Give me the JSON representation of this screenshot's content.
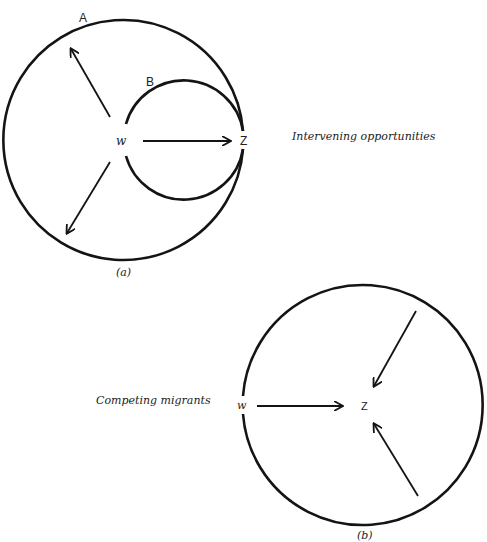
{
  "panel_a": {
    "caption": "(a)",
    "outer_circle_label": "A",
    "inner_circle_label": "B",
    "origin_label": "w",
    "destination_label": "Z",
    "description": "Intervening opportunities"
  },
  "panel_b": {
    "caption": "(b)",
    "origin_label": "w",
    "destination_label": "Z",
    "description": "Competing migrants"
  },
  "colors": {
    "ink": "#141414",
    "background": "#ffffff"
  }
}
